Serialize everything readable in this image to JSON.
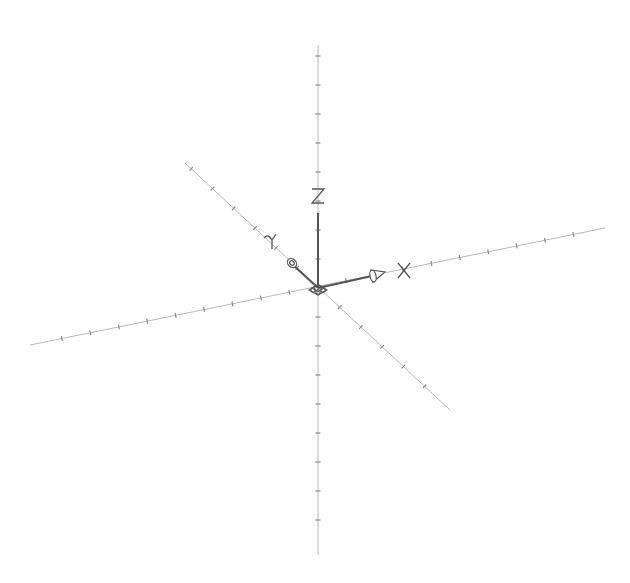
{
  "diagram": {
    "type": "3d-coordinate-axes",
    "background": "#ffffff",
    "line_color": "#b8b8b8",
    "icon_color": "#555555",
    "origin": [
      318,
      288
    ],
    "axes": [
      {
        "name": "X",
        "label": "X",
        "start": [
          30,
          345
        ],
        "end": [
          605,
          228
        ],
        "arrow_tip": [
          384,
          272
        ],
        "label_pos": [
          404,
          270
        ]
      },
      {
        "name": "Y",
        "label": "Y",
        "start": [
          450,
          410
        ],
        "end": [
          185,
          163
        ],
        "arrow_tip": [
          287,
          260
        ],
        "label_pos": [
          272,
          241
        ]
      },
      {
        "name": "Z",
        "label": "Z",
        "start": [
          318,
          555
        ],
        "end": [
          318,
          45
        ],
        "arrow_tip": [
          318,
          212
        ],
        "label_pos": [
          318,
          196
        ]
      }
    ]
  },
  "labels": {
    "x": "X",
    "y": "Y",
    "z": "Z"
  }
}
